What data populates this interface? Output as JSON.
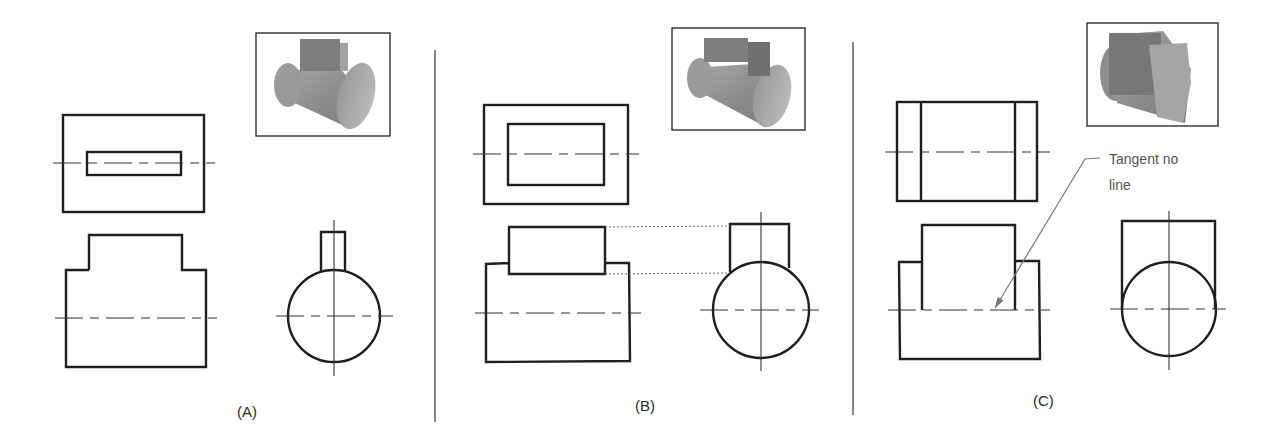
{
  "figure": {
    "panels": [
      {
        "id": "A",
        "caption": "(A)",
        "caption_pos": [
          237,
          403
        ],
        "pictorial": {
          "rect": [
            256,
            33,
            134,
            103
          ],
          "shape": "cylinder-with-narrow-key"
        },
        "top_view": {
          "outer": [
            63,
            115,
            141,
            97
          ],
          "inner_rects": [
            [
              87,
              152,
              94,
              23
            ]
          ],
          "inner_vlines": [],
          "centerline": {
            "y": 163,
            "x1": 53,
            "x2": 215
          }
        },
        "front_view": {
          "outline": [
            [
              89,
              270
            ],
            [
              89,
              235
            ],
            [
              182,
              235
            ],
            [
              182,
              270
            ],
            [
              206,
              270
            ],
            [
              206,
              367
            ],
            [
              66,
              367
            ],
            [
              66,
              270
            ],
            [
              89,
              270
            ]
          ],
          "extra_lines": [],
          "centerline": {
            "y": 318,
            "x1": 55,
            "x2": 217
          }
        },
        "side_view": {
          "circle": {
            "cx": 334,
            "cy": 316,
            "r": 46
          },
          "key": [
            [
              321,
              271
            ],
            [
              321,
              232
            ],
            [
              345,
              232
            ],
            [
              345,
              271
            ]
          ],
          "vcenter": {
            "x": 334,
            "y1": 220,
            "y2": 376
          },
          "hcenter": {
            "y": 316,
            "x1": 276,
            "x2": 393
          }
        },
        "projection_lines": []
      },
      {
        "id": "B",
        "caption": "(B)",
        "caption_pos": [
          635,
          397
        ],
        "pictorial": {
          "rect": [
            672,
            28,
            133,
            102
          ],
          "shape": "cylinder-with-block"
        },
        "top_view": {
          "outer": [
            484,
            105,
            144,
            99
          ],
          "inner_rects": [
            [
              508,
              124,
              96,
              61
            ]
          ],
          "inner_vlines": [],
          "centerline": {
            "y": 154,
            "x1": 473,
            "x2": 639
          }
        },
        "front_view": {
          "outline": [
            [
              509,
              263
            ],
            [
              509,
              227
            ],
            [
              605,
              227
            ],
            [
              605,
              274
            ],
            [
              509,
              274
            ],
            [
              509,
              263
            ],
            [
              486,
              264
            ],
            [
              486,
              362
            ],
            [
              630,
              361
            ],
            [
              629,
              263
            ],
            [
              605,
              263
            ]
          ],
          "extra_lines": [],
          "centerline": {
            "y": 313,
            "x1": 475,
            "x2": 641
          }
        },
        "side_view": {
          "circle": {
            "cx": 761,
            "cy": 310,
            "r": 48
          },
          "key": [
            [
              730,
              272
            ],
            [
              730,
              224
            ],
            [
              789,
              224
            ],
            [
              789,
              268
            ]
          ],
          "vcenter": {
            "x": 761,
            "y1": 212,
            "y2": 371
          },
          "hcenter": {
            "y": 310,
            "x1": 700,
            "x2": 819
          }
        },
        "projection_lines": [
          {
            "x1": 605,
            "y1": 227,
            "x2": 730,
            "y2": 226
          },
          {
            "x1": 605,
            "y1": 274,
            "x2": 730,
            "y2": 273
          }
        ]
      },
      {
        "id": "C",
        "caption": "(C)",
        "caption_pos": [
          1033,
          392
        ],
        "pictorial": {
          "rect": [
            1087,
            23,
            131,
            103
          ],
          "shape": "cylinder-with-full-width-block"
        },
        "top_view": {
          "outer": [
            897,
            102,
            140,
            99
          ],
          "inner_rects": [],
          "inner_vlines": [
            921,
            1015
          ],
          "centerline": {
            "y": 152,
            "x1": 885,
            "x2": 1050
          }
        },
        "front_view": {
          "outline": [
            [
              922,
              310
            ],
            [
              922,
              225
            ],
            [
              1015,
              225
            ],
            [
              1015,
              310
            ]
          ],
          "extra_lines": [
            [
              [
                922,
                262
              ],
              [
                899,
                262
              ],
              [
                900,
                359
              ],
              [
                1040,
                359
              ],
              [
                1039,
                261
              ],
              [
                1015,
                261
              ]
            ]
          ],
          "centerline": {
            "y": 310,
            "x1": 888,
            "x2": 1050
          }
        },
        "side_view": {
          "circle": {
            "cx": 1169,
            "cy": 309,
            "r": 47
          },
          "key": [
            [
              1122,
              309
            ],
            [
              1122,
              221
            ],
            [
              1215,
              221
            ],
            [
              1215,
              309
            ]
          ],
          "vcenter": {
            "x": 1169,
            "y1": 211,
            "y2": 370
          },
          "hcenter": {
            "y": 309,
            "x1": 1110,
            "x2": 1226
          }
        },
        "projection_lines": [],
        "annotation": {
          "text_line1": "Tangent no",
          "text_line2": "line",
          "text_pos": [
            1109,
            146
          ],
          "leader": [
            [
              1100,
              158
            ],
            [
              1085,
              159
            ],
            [
              995,
              308
            ]
          ]
        }
      }
    ],
    "dividers": [
      {
        "x": 435,
        "y1": 50,
        "y2": 422
      },
      {
        "x": 853,
        "y1": 42,
        "y2": 415
      }
    ],
    "colors": {
      "line": "#1e1e1e",
      "thin_line": "#333333",
      "leader": "#777777",
      "divider": "#444444",
      "pictorial_light": "#b4b4b4",
      "pictorial_mid": "#8c8c8c",
      "pictorial_dark": "#6a6a6a"
    }
  }
}
